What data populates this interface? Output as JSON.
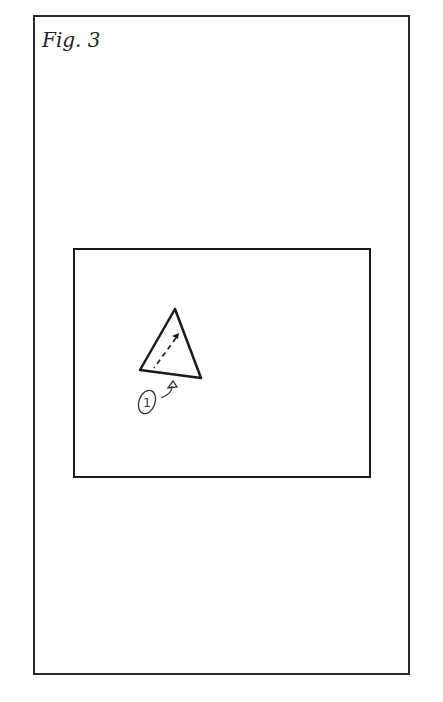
{
  "figure": {
    "label": "Fig. 3",
    "callout_number": "1"
  },
  "colors": {
    "ink": "#1a1a1a",
    "paper": "#ffffff"
  }
}
